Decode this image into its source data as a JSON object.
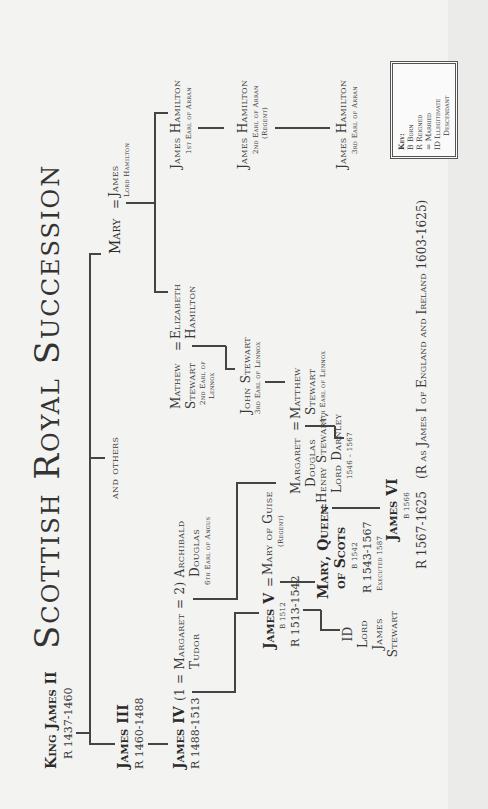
{
  "title": "Scottish Royal Succession",
  "key": {
    "label": "Key:",
    "items": [
      "B  Born",
      "R  Reigned",
      "=  Married",
      "ID Illegitimate",
      "Descendant"
    ]
  },
  "people": {
    "james_ii": {
      "name": "King James II",
      "reign": "R 1437-1460"
    },
    "james_iii": {
      "name": "James III",
      "reign": "R 1460-1488"
    },
    "james_iv": {
      "name": "James IV",
      "reign": "R 1488-1513",
      "marriage": "(1 = Margaret",
      "spouse_line2": "Tudor"
    },
    "archibald": {
      "prefix": "= 2) Archibald",
      "line2": "Douglas",
      "title": "6th Earl of Angus"
    },
    "and_others": {
      "name": "and others"
    },
    "mary": {
      "name": "Mary",
      "marriage": "="
    },
    "james_lord_hamilton": {
      "name": "James",
      "title": "Lord Hamilton"
    },
    "elizabeth_hamilton": {
      "line1": "Elizabeth",
      "line2": "Hamilton"
    },
    "mathew_stewart_2": {
      "line1": "Mathew",
      "line2": "Stewart",
      "title1": "2nd Earl of",
      "title2": "Lennox",
      "marriage": "="
    },
    "john_stewart": {
      "name": "John Stewart",
      "title": "3rd Earl of Lennox"
    },
    "matthew_stewart_4": {
      "line1": "Matthew",
      "line2": "Stewart",
      "title": "4th Earl of Lennox"
    },
    "margaret_douglas": {
      "line1": "Margaret",
      "line2": "Douglas",
      "marriage": "="
    },
    "james_hamilton_1": {
      "name": "James Hamilton",
      "title": "1st Earl of Arran"
    },
    "james_hamilton_2": {
      "name": "James Hamilton",
      "title": "2nd Earl of Arran",
      "note": "(Regent)"
    },
    "james_hamilton_3": {
      "name": "James Hamilton",
      "title": "3rd Earl of Arran"
    },
    "james_v": {
      "name": "James V",
      "born": "B 1512",
      "reign": "R 1513-1542",
      "marriage": "="
    },
    "mary_of_guise": {
      "name": "Mary of Guise",
      "note": "(Regent)"
    },
    "lord_james_stewart": {
      "line1": "ID",
      "line2": "Lord",
      "line3": "James",
      "line4": "Stewart"
    },
    "mary_queen_of_scots": {
      "line1": "Mary, Queen",
      "line2": "of Scots",
      "born": "B 1542",
      "reign": "R 1543-1567",
      "note": "Executed 1587",
      "marriage": "="
    },
    "darnley": {
      "line1": "Henry Stewart,",
      "line2": "Lord Darnley",
      "dates": "1546 – 1567"
    },
    "james_vi": {
      "name": "James VI",
      "born": "B 1566",
      "reign": "R 1567-1625",
      "note": "(R as James I of England and Ireland 1603-1625)"
    }
  }
}
